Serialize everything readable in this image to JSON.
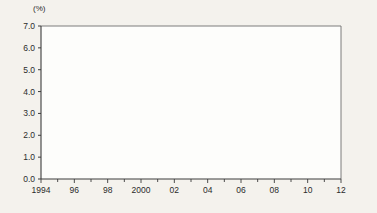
{
  "chart_data": {
    "type": "line",
    "title": "",
    "subtitle": "",
    "xlabel": "年",
    "ylabel": "(%)",
    "unit": "(%)",
    "grid": false,
    "legend_position": "top-right",
    "xlim": [
      1994,
      2012
    ],
    "ylim": [
      0.0,
      7.0
    ],
    "ytick_labels": [
      "0.0",
      "1.0",
      "2.0",
      "3.0",
      "4.0",
      "5.0",
      "6.0",
      "7.0"
    ],
    "ytick_values": [
      0.0,
      1.0,
      2.0,
      3.0,
      4.0,
      5.0,
      6.0,
      7.0
    ],
    "xtick_labels": [
      "1994",
      "96",
      "98",
      "2000",
      "02",
      "04",
      "06",
      "08",
      "10",
      "12"
    ],
    "xtick_values": [
      1994,
      1996,
      1998,
      2000,
      2002,
      2004,
      2006,
      2008,
      2010,
      2012
    ],
    "x": [
      1994,
      1995,
      1996,
      1997,
      1998,
      1999,
      2000,
      2001,
      2002,
      2003,
      2004,
      2005,
      2006,
      2007,
      2008,
      2009,
      2010,
      2011,
      2012
    ],
    "series": [
      {
        "name": "日本",
        "color": "#14100e",
        "width": 2.8,
        "dash": "none",
        "values": [
          6.1,
          6.0,
          5.95,
          6.2,
          5.85,
          5.6,
          5.45,
          5.4,
          5.8,
          5.3,
          5.05,
          5.0,
          4.75,
          4.3,
          3.9,
          3.45,
          3.2,
          3.3,
          3.1
        ]
      },
      {
        "name": "アメリカ",
        "color": "#8a8a85",
        "width": 2.8,
        "dash": "none",
        "values": [
          3.8,
          3.78,
          3.75,
          3.7,
          3.68,
          3.6,
          3.5,
          3.55,
          3.65,
          3.68,
          3.7,
          3.72,
          3.7,
          3.75,
          3.9,
          4.15,
          3.95,
          3.7,
          3.5
        ]
      },
      {
        "name": "イギリス",
        "color": "#1d1b18",
        "width": 1.1,
        "dash": "none",
        "values": [
          2.1,
          1.9,
          1.75,
          1.6,
          1.5,
          1.45,
          1.4,
          1.45,
          1.5,
          1.55,
          1.6,
          0.65,
          1.5,
          1.6,
          1.8,
          2.3,
          2.0,
          1.95,
          1.9
        ]
      },
      {
        "name": "ドイツ",
        "color": "#6b6760",
        "width": 1.1,
        "dash": "1,1.6",
        "values": [
          3.4,
          3.35,
          3.3,
          3.15,
          3.0,
          2.9,
          2.85,
          2.8,
          2.78,
          2.75,
          2.8,
          2.82,
          2.9,
          2.95,
          3.05,
          3.3,
          3.1,
          3.05,
          3.0
        ]
      },
      {
        "name": "フランス",
        "color": "#3b3832",
        "width": 2.0,
        "dash": "none",
        "values": [
          2.5,
          2.4,
          2.3,
          2.2,
          2.1,
          1.95,
          1.8,
          1.75,
          1.72,
          1.7,
          1.68,
          1.65,
          1.62,
          1.6,
          1.65,
          1.85,
          1.7,
          1.6,
          1.5
        ]
      }
    ]
  },
  "legend": {
    "items": [
      {
        "label": "日本"
      },
      {
        "label": "アメリカ"
      },
      {
        "label": "イギリス"
      },
      {
        "label": "ドイツ"
      },
      {
        "label": "フランス"
      }
    ]
  },
  "axes": {
    "y_unit": "(%)",
    "x_unit": "(年)"
  }
}
